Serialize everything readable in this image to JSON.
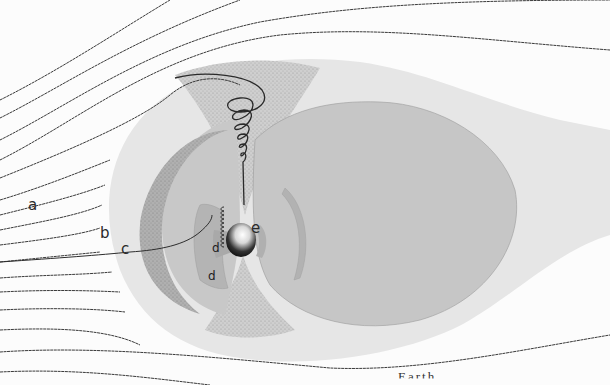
{
  "diagram": {
    "labels": {
      "a": "a",
      "b": "b",
      "c": "c",
      "d1": "d",
      "d2": "d",
      "e": "e"
    },
    "caption_partial": "Earth ...",
    "colors": {
      "background": "#fcfcfc",
      "magnetosheath": "#e6e6e6",
      "magnetosphere": "#c7c7c7",
      "outer_belt": "#b3b3b3",
      "inner_belt": "#b0b0b0",
      "cusp_stipple": "#8a8a8a",
      "field_lines": "#3a3a3a",
      "earth_dark": "#111111",
      "earth_light": "#ffffff"
    }
  }
}
